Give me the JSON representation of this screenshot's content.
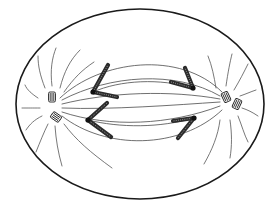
{
  "figure": {
    "title": "Cell in anaphase of mitosis",
    "width": 280,
    "height": 215,
    "background": "#ffffff",
    "stroke_color": "#1a1a1a"
  },
  "cell_membrane": {
    "cx": 140,
    "cy": 104,
    "rx": 124,
    "ry": 95
  },
  "poles": [
    {
      "name": "left-pole",
      "x": 53,
      "y": 105
    },
    {
      "name": "right-pole",
      "x": 228,
      "y": 100
    }
  ],
  "centrioles": [
    {
      "name": "left-centriole-1",
      "x": 52,
      "y": 97,
      "angle": 0
    },
    {
      "name": "left-centriole-2",
      "x": 56,
      "y": 117,
      "angle": -55
    },
    {
      "name": "right-centriole-1",
      "x": 226,
      "y": 97,
      "angle": -25
    },
    {
      "name": "right-centriole-2",
      "x": 237,
      "y": 104,
      "angle": 25
    }
  ],
  "chromosomes": [
    {
      "name": "chromosome-left-upper",
      "kinetochore": [
        93,
        92
      ],
      "arms": [
        [
          108,
          65
        ],
        [
          117,
          97
        ]
      ]
    },
    {
      "name": "chromosome-left-lower",
      "kinetochore": [
        88,
        120
      ],
      "arms": [
        [
          107,
          103
        ],
        [
          111,
          137
        ]
      ]
    },
    {
      "name": "chromosome-right-upper",
      "kinetochore": [
        193,
        88
      ],
      "arms": [
        [
          171,
          82
        ],
        [
          185,
          68
        ]
      ]
    },
    {
      "name": "chromosome-right-lower",
      "kinetochore": [
        194,
        118
      ],
      "arms": [
        [
          173,
          121
        ],
        [
          178,
          138
        ]
      ]
    }
  ],
  "spindle_fibers": [
    "M 60 98 C 100 60, 180 50, 222 92",
    "M 62 100 C 110 75, 175 70, 220 96",
    "M 62 104 C 110 92, 170 90, 220 99",
    "M 62 108 C 110 110, 175 105, 220 102",
    "M 62 112 C 110 128, 170 125, 220 106",
    "M 62 116 C 105 150, 180 150, 222 110",
    "M 93 92 C 120 80, 160 78, 193 88",
    "M 88 120 C 120 128, 160 128, 194 118"
  ],
  "astral_rays": [
    "M 45 88 C 40 75, 38 66, 38 56",
    "M 52 86 C 50 70, 52 58, 56 48",
    "M 60 88 C 64 72, 70 60, 80 50",
    "M 64 92 C 74 78, 82 70, 94 62",
    "M 38 98 C 32 94, 27 90, 25 85",
    "M 40 108 C 32 108, 28 108, 22 108",
    "M 42 116 C 34 120, 30 124, 26 130",
    "M 48 124 C 44 132, 40 142, 36 152",
    "M 55 126 C 56 140, 58 152, 62 166",
    "M 64 124 C 76 140, 90 152, 112 168",
    "M 216 88 C 214 76, 212 66, 208 56",
    "M 226 86 C 228 72, 230 62, 232 54",
    "M 234 90 C 240 80, 244 72, 248 64",
    "M 240 96 C 246 94, 250 92, 256 90",
    "M 242 108 C 248 110, 252 112, 258 116",
    "M 238 116 C 242 126, 244 134, 248 142",
    "M 230 120 C 232 134, 232 146, 230 158",
    "M 220 120 C 218 136, 212 150, 204 164"
  ]
}
